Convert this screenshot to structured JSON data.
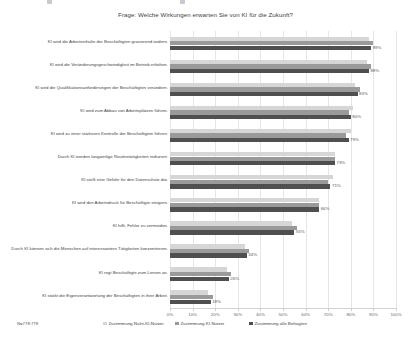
{
  "title": "Frage: Welche Wirkungen erwarten Sie von KI für die Zukunft?",
  "note": "N=778:778",
  "legend": [
    {
      "label": "Zustimmung Nicht-KI-Nutzer",
      "color": "#d6d6d6"
    },
    {
      "label": "Zustimmung KI-Nutzer",
      "color": "#9a9a9a"
    },
    {
      "label": "Zustimmung alle Befragten",
      "color": "#4f4f4f"
    }
  ],
  "chart_data": {
    "type": "bar",
    "orientation": "horizontal",
    "title": "Frage: Welche Wirkungen erwarten Sie von KI für die Zukunft?",
    "xlabel": "",
    "ylabel": "",
    "xlim": [
      0,
      100
    ],
    "grid": true,
    "legend_position": "bottom",
    "xticks": [
      "0%",
      "10%",
      "20%",
      "30%",
      "40%",
      "50%",
      "60%",
      "70%",
      "80%",
      "90%",
      "100%"
    ],
    "xtick_values": [
      0,
      10,
      20,
      30,
      40,
      50,
      60,
      70,
      80,
      90,
      100
    ],
    "categories": [
      "KI wird die Arbeitsinhalte der Beschäftigten gravierend ändern.",
      "KI wird die Veränderungsgeschwindigkeit im Betrieb erhöhen.",
      "KI wird die Qualifikationsanforderungen der Beschäftigten verändern.",
      "KI wird zum Abbau von Arbeitsplätzen führen.",
      "KI wird zu einer stärkeren Kontrolle der Beschäftigten führen.",
      "Durch KI werden langweilige Routinetätigkeiten reduziert.",
      "KI stellt eine Gefahr für den Datenschutz dar.",
      "KI wird den Arbeitsdruck für Beschäftigte steigern.",
      "KI hilft, Fehler zu vermeiden.",
      "Durch KI können sich die Menschen auf interessantere Tätigkeiten konzentrieren.",
      "KI regt Beschäftigte zum Lernen an.",
      "KI stärkt die Eigenverantwortung der Beschäftigten in ihrer Arbeit."
    ],
    "series": [
      {
        "name": "Zustimmung Nicht-KI-Nutzer",
        "color": "#d6d6d6",
        "values": [
          88,
          87,
          82,
          81,
          80,
          73,
          72,
          66,
          54,
          33,
          25,
          17
        ]
      },
      {
        "name": "Zustimmung KI-Nutzer",
        "color": "#9a9a9a",
        "values": [
          90,
          89,
          84,
          79,
          78,
          73,
          70,
          66,
          56,
          35,
          27,
          19
        ]
      },
      {
        "name": "Zustimmung alle Befragten",
        "color": "#4f4f4f",
        "values": [
          89,
          88,
          83,
          80,
          79,
          73,
          71,
          66,
          55,
          34,
          26,
          18
        ]
      }
    ],
    "data_labels": [
      "89%",
      "88%",
      "83%",
      "80%",
      "79%",
      "73%",
      "71%",
      "66%",
      "55%",
      "34%",
      "26%",
      "18%"
    ]
  }
}
